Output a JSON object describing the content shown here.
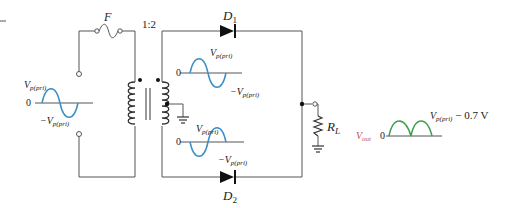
{
  "diagram": {
    "fuse": {
      "label": "F"
    },
    "transformer": {
      "ratio": "1:2"
    },
    "diodes": [
      {
        "id": "D1",
        "label": "D",
        "sub": "1"
      },
      {
        "id": "D2",
        "label": "D",
        "sub": "2"
      }
    ],
    "load": {
      "label": "R",
      "sub": "L"
    },
    "input_wave": {
      "pos": "V",
      "pos_sub": "p(pri)",
      "zero": "0",
      "neg": "−V",
      "neg_sub": "p(pri)"
    },
    "upper_wave": {
      "pos": "V",
      "pos_sub": "p(pri)",
      "zero": "0",
      "neg": "−V",
      "neg_sub": "p(pri)"
    },
    "lower_wave": {
      "pos": "V",
      "pos_sub": "p(pri)",
      "zero": "0",
      "neg": "−V",
      "neg_sub": "p(pri)"
    },
    "output": {
      "name": "V",
      "name_sub": "out",
      "zero": "0",
      "peak": "V",
      "peak_sub": "p(pri)",
      "peak_suffix": " − 0.7 V"
    },
    "colors": {
      "wire": "#555555",
      "sine": "#3a8fc7",
      "output_wave": "#3aa04a",
      "vout_label": "#c0504d"
    }
  }
}
